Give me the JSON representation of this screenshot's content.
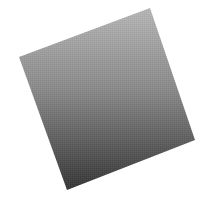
{
  "image": {
    "subject": "rotated grey gradient square",
    "background_color": "#ffffff",
    "shape": {
      "type": "quadrilateral",
      "corners": {
        "top": [
          150,
          8
        ],
        "right": [
          195,
          140
        ],
        "bottom": [
          67,
          190
        ],
        "left": [
          19,
          57
        ]
      },
      "gradient": {
        "top_color": "#b4b4b4",
        "bottom_color": "#3a3a3a"
      }
    }
  }
}
